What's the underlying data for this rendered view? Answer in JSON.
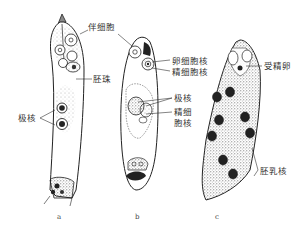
{
  "figure": {
    "panels": [
      {
        "id": "a",
        "caption": "a",
        "labels": {
          "synergid": "伴细胞",
          "ovule_embryo": "胚珠",
          "polar_nuclei": "极核"
        }
      },
      {
        "id": "b",
        "caption": "b",
        "labels": {
          "egg_nucleus": "卵细胞核",
          "sperm_nucleus_top": "精细胞核",
          "polar_nuclei": "极核",
          "sperm_nucleus_line1": "精细",
          "sperm_nucleus_line2": "胞核"
        }
      },
      {
        "id": "c",
        "caption": "c",
        "labels": {
          "zygote": "受精卵",
          "endosperm_nucleus": "胚乳核"
        }
      }
    ],
    "colors": {
      "ink": "#1a1a1a",
      "stipple": "#555555",
      "background": "#ffffff"
    }
  }
}
